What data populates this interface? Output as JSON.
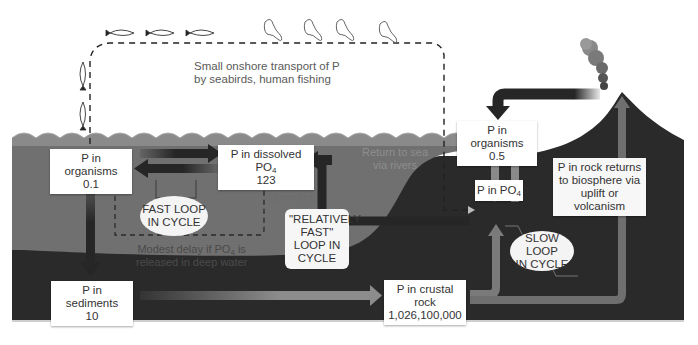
{
  "diagram": {
    "colors": {
      "ocean": "#6f6f6f",
      "land": "#2a2a2a",
      "arrow_dark": "#262626",
      "arrow_light": "#8a8a8a",
      "box_bg": "#ffffff"
    },
    "nodes": {
      "ocean_organisms": {
        "label": "P in organisms",
        "value": "0.1"
      },
      "dissolved_po4": {
        "label": "P in dissolved PO",
        "sub": "4",
        "value": "123"
      },
      "sediments": {
        "label": "P in sediments",
        "value": "10"
      },
      "crustal_rock": {
        "label": "P in crustal rock",
        "value": "1,026,100,000"
      },
      "land_organisms": {
        "label": "P in organisms",
        "value": "0.5"
      },
      "land_po4": {
        "label": "P in PO",
        "sub": "4"
      }
    },
    "loops": {
      "fast": {
        "line1": "FAST LOOP",
        "line2": "IN CYCLE"
      },
      "relatively_fast": {
        "line1": "\"RELATIVELY",
        "line2": "FAST\"",
        "line3": "LOOP IN",
        "line4": "CYCLE"
      },
      "slow": {
        "line1": "SLOW LOOP",
        "line2": "IN CYCLE"
      }
    },
    "annotations": {
      "onshore_line1": "Small onshore transport of P",
      "onshore_line2": "by seabirds, human fishing",
      "upwelling": "Upwelling",
      "delay_line1": "Modest delay if PO",
      "delay_sub": "4",
      "delay_line1_end": " is",
      "delay_line2": "released in deep water",
      "rivers_line1": "Return to sea",
      "rivers_line2": "via rivers",
      "rock_line1": "P in rock returns",
      "rock_line2": "to biosphere via",
      "rock_line3": "uplift or volcanism"
    },
    "icons": [
      "fish-icon",
      "seabird-icon",
      "volcano-smoke-icon",
      "arrow-icon"
    ]
  }
}
